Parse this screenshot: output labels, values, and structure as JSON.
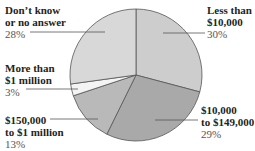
{
  "chart_data": {
    "type": "pie",
    "title": "",
    "start_angle": "12 o'clock",
    "direction": "clockwise",
    "slices": [
      {
        "label": "Less than $10,000",
        "value": 30,
        "pct_label": "30%",
        "color": "#cdcdcd"
      },
      {
        "label": "$10,000 to $149,000",
        "value": 29,
        "pct_label": "29%",
        "color": "#a9a9a9"
      },
      {
        "label": "$150,000 to $1 million",
        "value": 13,
        "pct_label": "13%",
        "color": "#b9b9b9"
      },
      {
        "label": "More than $1 million",
        "value": 3,
        "pct_label": "3%",
        "color": "#f4f4f4"
      },
      {
        "label": "Don't know or no answer",
        "value": 28,
        "pct_label": "28%",
        "color": "#d8d8d8"
      }
    ]
  },
  "labels": {
    "dont_know": {
      "line1": "Don’t know",
      "line2": "or no answer",
      "pct": "28%"
    },
    "less_10k": {
      "line1": "Less than",
      "line2": "$10,000",
      "pct": "30%"
    },
    "more_1m": {
      "line1": "More than",
      "line2": "$1 million",
      "pct": "3%"
    },
    "k150_1m": {
      "line1": "$150,000",
      "line2": "to $1 million",
      "pct": "13%"
    },
    "k10_149k": {
      "line1": "$10,000",
      "line2": "to $149,000",
      "pct": "29%"
    }
  }
}
